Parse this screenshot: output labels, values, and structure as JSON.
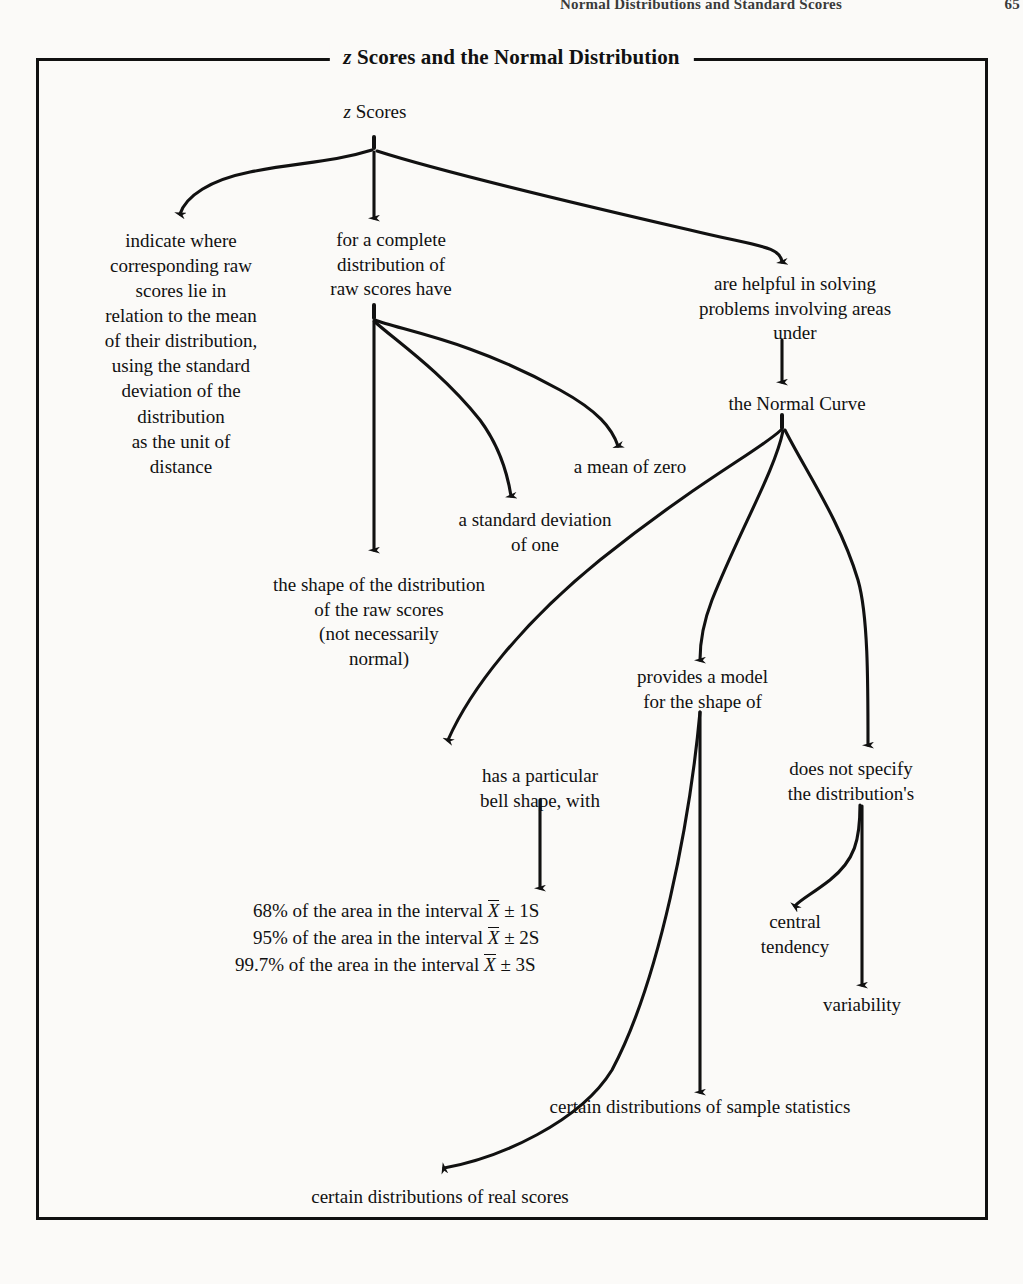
{
  "running_head": {
    "text": "Normal Distributions and Standard Scores",
    "page_number": "65"
  },
  "figure": {
    "title_prefix": "z",
    "title_rest": " Scores and the Normal Distribution",
    "title_full": "z Scores and the Normal Distribution"
  },
  "nodes": {
    "root": "z Scores",
    "root_italic_prefix": "z",
    "root_rest": " Scores",
    "indicate_where": "indicate where\ncorresponding raw\nscores lie in\nrelation to the mean\nof their distribution,\nusing the standard\ndeviation of the\ndistribution\nas the unit of\ndistance",
    "for_a_complete": "for a complete\ndistribution of\nraw scores have",
    "are_helpful": "are helpful in solving\nproblems involving areas\nunder",
    "normal_curve": "the Normal Curve",
    "mean_of_zero": "a mean of zero",
    "standard_deviation_of_one": "a standard deviation\nof one",
    "shape_of_distribution": "the shape of the distribution\nof the raw scores\n(not necessarily\nnormal)",
    "provides_a_model": "provides a model\nfor the shape of",
    "does_not_specify": "does not specify\nthe distribution's",
    "bell_shape": "has a particular\nbell shape, with",
    "central_tendency": "central\ntendency",
    "variability": "variability",
    "sample_statistics": "certain distributions of sample statistics",
    "real_scores": "certain distributions of real scores"
  },
  "formulas": {
    "line1_pre": "68% of the area in the interval ",
    "line1_var": "X",
    "line1_post": " ± 1S",
    "line2_pre": "95% of the area in the interval ",
    "line2_var": "X",
    "line2_post": " ± 2S",
    "line3_pre": "99.7% of the area in the interval ",
    "line3_var": "X",
    "line3_post": " ± 3S"
  },
  "colors": {
    "ink": "#111111",
    "paper": "#fbfaf8"
  }
}
